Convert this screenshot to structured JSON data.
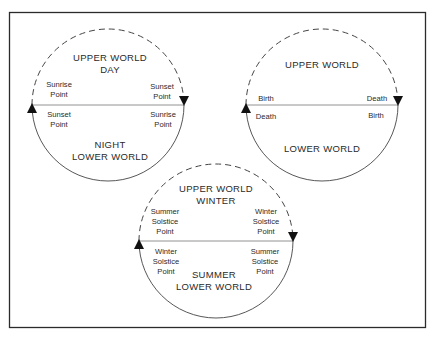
{
  "diagram": {
    "frame": {
      "stroke": "#2b2b2b"
    },
    "colors": {
      "ink": "#2a2a2a",
      "line": "#555555"
    },
    "circles": [
      {
        "id": "day-night",
        "cx": 108,
        "cy": 105,
        "r": 76,
        "upper_title": [
          "UPPER WORLD",
          "DAY"
        ],
        "lower_title": [
          "NIGHT",
          "LOWER WORLD"
        ],
        "upper_left": [
          "Sunrise",
          "Point"
        ],
        "upper_right": [
          "Sunset",
          "Point"
        ],
        "lower_left": [
          "Sunset",
          "Point"
        ],
        "lower_right": [
          "Sunrise",
          "Point"
        ]
      },
      {
        "id": "life-death",
        "cx": 322,
        "cy": 105,
        "r": 76,
        "upper_title": [
          "UPPER WORLD"
        ],
        "lower_title": [
          "LOWER WORLD"
        ],
        "upper_left": [
          "Birth"
        ],
        "upper_right": [
          "Death"
        ],
        "lower_left": [
          "Death"
        ],
        "lower_right": [
          "Birth"
        ]
      },
      {
        "id": "seasons",
        "cx": 216,
        "cy": 241,
        "r": 77,
        "upper_title": [
          "UPPER WORLD",
          "WINTER"
        ],
        "lower_title": [
          "SUMMER",
          "LOWER WORLD"
        ],
        "upper_left": [
          "Summer",
          "Solstice",
          "Point"
        ],
        "upper_right": [
          "Winter",
          "Solstice",
          "Point"
        ],
        "lower_left": [
          "Winter",
          "Solstice",
          "Point"
        ],
        "lower_right": [
          "Summer",
          "Solstice",
          "Point"
        ]
      }
    ],
    "arrows": {
      "upper_arc": "dashed, clockwise, arrowhead at right end pointing down",
      "lower_arc": "solid, arrowhead at left end pointing up"
    }
  }
}
